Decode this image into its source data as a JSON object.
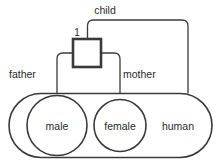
{
  "diagram": {
    "stroke_color": "#3a3a3a",
    "text_color": "#2b2b2b",
    "background_color": "#ffffff",
    "relationship_box": {
      "cardinality_label": "1",
      "name": "relationship-box"
    },
    "edges": [
      {
        "id": "child",
        "label": "child"
      },
      {
        "id": "father",
        "label": "father"
      },
      {
        "id": "mother",
        "label": "mother"
      }
    ],
    "sets": [
      {
        "id": "human",
        "label": "human",
        "shape": "stadium"
      },
      {
        "id": "male",
        "label": "male",
        "shape": "circle"
      },
      {
        "id": "female",
        "label": "female",
        "shape": "circle"
      }
    ]
  }
}
